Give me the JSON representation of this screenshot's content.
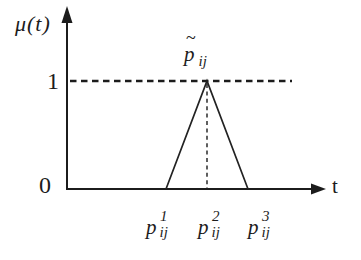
{
  "figure": {
    "type": "triangular-fuzzy-membership-function",
    "background_color": "#ffffff",
    "line_color": "#1c1c1c",
    "y_axis": {
      "label": "μ(t)",
      "ticks": [
        "0",
        "1"
      ]
    },
    "x_axis": {
      "label": "t"
    },
    "peak_label": {
      "tilde": "~",
      "base": "p",
      "sub": "ij"
    },
    "x_tick_labels": [
      {
        "base": "p",
        "sup": "1",
        "sub": "ij"
      },
      {
        "base": "p",
        "sup": "2",
        "sub": "ij"
      },
      {
        "base": "p",
        "sup": "3",
        "sub": "ij"
      }
    ],
    "content": {
      "dashed_level": "1",
      "left_support": "p1_ij at membership 0",
      "peak": "p2_ij at membership 1",
      "right_support": "p3_ij at membership 0"
    }
  }
}
